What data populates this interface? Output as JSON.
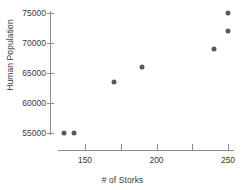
{
  "chart_data": {
    "type": "scatter",
    "title": "",
    "xlabel": "# of Storks",
    "ylabel": "Human Population",
    "xlim": [
      128,
      258
    ],
    "ylim": [
      54000,
      76000
    ],
    "grid": false,
    "legend": null,
    "marker_color": "#5a5a5a",
    "axis_color": "#8c8c8c",
    "text_color": "#3a3a3a",
    "xticks": [
      150,
      175,
      200,
      225,
      250
    ],
    "xtick_labels": [
      "150",
      "",
      "200",
      "",
      "250"
    ],
    "yticks": [
      55000,
      60000,
      65000,
      70000,
      75000
    ],
    "ytick_labels": [
      "55000",
      "60000",
      "65000",
      "70000",
      "75000"
    ],
    "points": [
      {
        "x": 135,
        "y": 55000
      },
      {
        "x": 142,
        "y": 55000
      },
      {
        "x": 170,
        "y": 63500
      },
      {
        "x": 190,
        "y": 66000
      },
      {
        "x": 240,
        "y": 69000
      },
      {
        "x": 250,
        "y": 72000
      },
      {
        "x": 250,
        "y": 75000
      }
    ]
  }
}
